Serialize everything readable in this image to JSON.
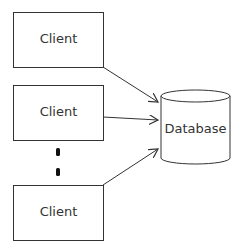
{
  "diagram": {
    "clients": [
      {
        "label": "Client"
      },
      {
        "label": "Client"
      },
      {
        "label": "Client"
      }
    ],
    "database": {
      "label": "Database"
    },
    "ellipsis": "vertical-dots",
    "colors": {
      "stroke": "#333333",
      "background": "#ffffff"
    }
  }
}
